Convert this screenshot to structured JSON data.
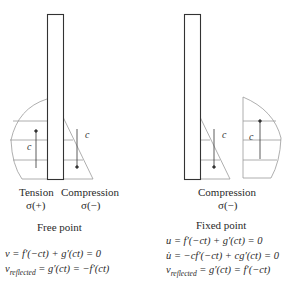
{
  "left_panel": {
    "tension_label": "Tension",
    "tension_sign": "σ(+)",
    "compression_label": "Compression",
    "compression_sign": "σ(−)",
    "caption": "Free point",
    "wave_label_tension": "c",
    "wave_label_compression": "c",
    "equations": [
      "v = f′(−ct) + g′(ct) = 0",
      "v",
      "reflected",
      " = g′(ct) = −f′(ct)"
    ]
  },
  "right_panel": {
    "compression_label": "Compression",
    "compression_sign": "σ(−)",
    "caption": "Fixed point",
    "wave_label_incident": "c",
    "wave_label_reflected": "c",
    "equations": [
      "u = f′(−ct) + g′(ct) = 0",
      "u̇ = −cf′(−ct) + cg′(ct) = 0",
      "v",
      "reflected",
      " = g′(ct) = f′(−ct)"
    ]
  },
  "colors": {
    "bar_stroke": "#333333",
    "wave_stroke": "#9a9a9a",
    "text": "#2a2a2a"
  }
}
